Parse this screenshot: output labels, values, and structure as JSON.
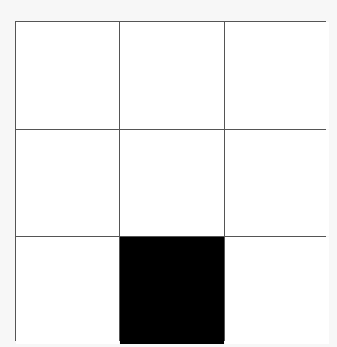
{
  "grid": {
    "rows": 3,
    "columns": 3,
    "line_color": "#555555",
    "empty_color": "#ffffff",
    "filled_color": "#000000",
    "cells": [
      {
        "row": 1,
        "col": 1,
        "filled": false
      },
      {
        "row": 1,
        "col": 2,
        "filled": false
      },
      {
        "row": 1,
        "col": 3,
        "filled": false
      },
      {
        "row": 2,
        "col": 1,
        "filled": false
      },
      {
        "row": 2,
        "col": 2,
        "filled": false
      },
      {
        "row": 2,
        "col": 3,
        "filled": false
      },
      {
        "row": 3,
        "col": 1,
        "filled": false
      },
      {
        "row": 3,
        "col": 2,
        "filled": true
      },
      {
        "row": 3,
        "col": 3,
        "filled": false
      }
    ]
  }
}
